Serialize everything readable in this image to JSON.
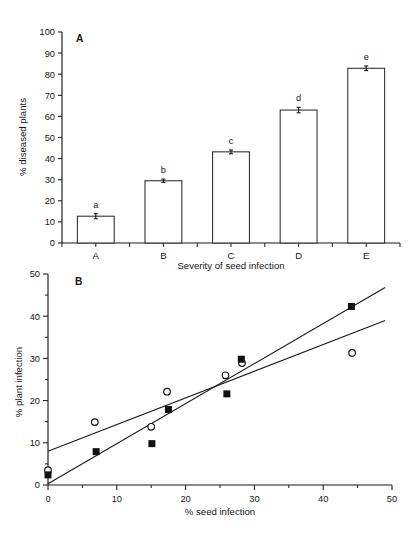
{
  "figure": {
    "panel_a_label": "A",
    "panel_b_label": "B"
  },
  "chart_data": [
    {
      "type": "bar",
      "panel": "A",
      "title": "",
      "xlabel": "Severity of seed infection",
      "ylabel": "% diseased plants",
      "categories": [
        "A",
        "B",
        "C",
        "D",
        "E"
      ],
      "values": [
        12.7,
        29.5,
        43.2,
        63.0,
        82.8
      ],
      "errors": [
        1.2,
        0.8,
        0.9,
        1.3,
        1.1
      ],
      "point_labels": [
        "a",
        "b",
        "c",
        "d",
        "e"
      ],
      "ylim": [
        0,
        100
      ],
      "yticks": [
        0,
        10,
        20,
        30,
        40,
        50,
        60,
        70,
        80,
        90,
        100
      ],
      "ytick_labels": [
        "0",
        "10",
        "20",
        "30",
        "40",
        "50",
        "60",
        "70",
        "80",
        "90",
        "100"
      ],
      "grid": false,
      "legend": "none"
    },
    {
      "type": "scatter",
      "panel": "B",
      "title": "",
      "xlabel": "% seed infection",
      "ylabel": "% plant infection",
      "xlim": [
        0,
        50
      ],
      "ylim": [
        0,
        50
      ],
      "xticks": [
        0,
        10,
        20,
        30,
        40,
        50
      ],
      "xtick_labels": [
        "0",
        "10",
        "20",
        "30",
        "40",
        "50"
      ],
      "yticks": [
        0,
        10,
        20,
        30,
        40,
        50
      ],
      "ytick_labels": [
        "0",
        "10",
        "20",
        "30",
        "40",
        "50"
      ],
      "minor_tick_step": 5,
      "grid": false,
      "legend": "none",
      "series": [
        {
          "name": "open-circles",
          "marker": "open-circle",
          "points": [
            {
              "x": 0.0,
              "y": 3.5
            },
            {
              "x": 6.8,
              "y": 14.9
            },
            {
              "x": 15.0,
              "y": 13.8
            },
            {
              "x": 17.3,
              "y": 22.1
            },
            {
              "x": 25.8,
              "y": 26.0
            },
            {
              "x": 28.2,
              "y": 28.9
            },
            {
              "x": 44.2,
              "y": 31.3
            }
          ],
          "trendline": {
            "x0": 0.0,
            "y0": 8.0,
            "x1": 49.0,
            "y1": 39.0
          }
        },
        {
          "name": "filled-squares",
          "marker": "filled-square",
          "points": [
            {
              "x": 0.0,
              "y": 2.4
            },
            {
              "x": 7.0,
              "y": 7.9
            },
            {
              "x": 15.1,
              "y": 9.8
            },
            {
              "x": 17.5,
              "y": 17.9
            },
            {
              "x": 26.0,
              "y": 21.6
            },
            {
              "x": 28.1,
              "y": 29.8
            },
            {
              "x": 44.1,
              "y": 42.3
            }
          ],
          "trendline": {
            "x0": 0.0,
            "y0": 0.3,
            "x1": 49.0,
            "y1": 46.8
          }
        }
      ]
    }
  ]
}
